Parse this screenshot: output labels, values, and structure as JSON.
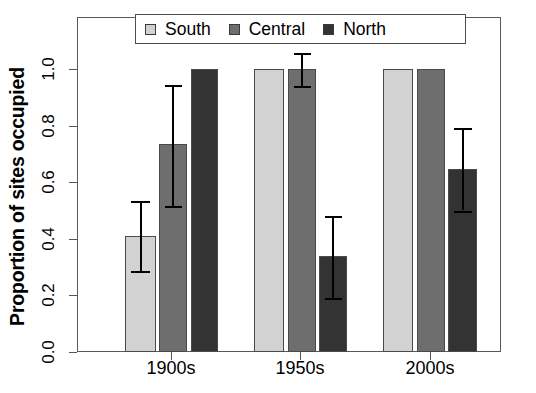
{
  "chart_data": {
    "type": "bar",
    "title": "",
    "subtitle": "",
    "xlabel": "",
    "ylabel": "Proportion of sites occupied",
    "categories": [
      "1900s",
      "1950s",
      "2000s"
    ],
    "ylim": [
      0.0,
      1.19
    ],
    "yticks": [
      "0.0",
      "0.2",
      "0.4",
      "0.6",
      "0.8",
      "1.0"
    ],
    "ytick_values": [
      0.0,
      0.2,
      0.4,
      0.6,
      0.8,
      1.0
    ],
    "grid": false,
    "legend_position": "top-center",
    "error_bars": "vertical with caps",
    "series": [
      {
        "name": "South",
        "color": "#d2d2d2",
        "values": [
          0.41,
          1.0,
          1.0
        ],
        "err_low": [
          0.285,
          1.0,
          1.0
        ],
        "err_high": [
          0.535,
          1.0,
          1.0
        ]
      },
      {
        "name": "Central",
        "color": "#6e6e6e",
        "values": [
          0.735,
          1.0,
          1.0
        ],
        "err_low": [
          0.515,
          0.94,
          1.0
        ],
        "err_high": [
          0.945,
          1.055,
          1.0
        ]
      },
      {
        "name": "North",
        "color": "#333333",
        "values": [
          1.0,
          0.34,
          0.645
        ],
        "err_low": [
          1.0,
          0.19,
          0.5
        ],
        "err_high": [
          1.0,
          0.48,
          0.79
        ]
      }
    ]
  },
  "legend": {
    "items": [
      {
        "label": "South",
        "color": "#d2d2d2"
      },
      {
        "label": "Central",
        "color": "#6e6e6e"
      },
      {
        "label": "North",
        "color": "#333333"
      }
    ]
  },
  "axes": {
    "y_title": "Proportion of sites occupied",
    "y_ticks": [
      "0.0",
      "0.2",
      "0.4",
      "0.6",
      "0.8",
      "1.0"
    ],
    "x_ticks": [
      "1900s",
      "1950s",
      "2000s"
    ]
  }
}
